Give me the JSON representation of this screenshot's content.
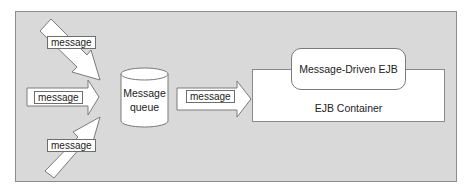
{
  "diagram": {
    "type": "architecture-flow",
    "incoming_messages": [
      {
        "label": "message",
        "direction": "diagonal-down"
      },
      {
        "label": "message",
        "direction": "horizontal"
      },
      {
        "label": "message",
        "direction": "diagonal-up"
      }
    ],
    "queue": {
      "line1": "Message",
      "line2": "queue"
    },
    "forward_message": {
      "label": "message"
    },
    "container": {
      "label": "EJB Container"
    },
    "bean": {
      "label": "Message-Driven EJB"
    },
    "colors": {
      "panel": "#d9d9d9",
      "boxes": "#ffffff",
      "stroke": "#7a7a7a"
    }
  }
}
